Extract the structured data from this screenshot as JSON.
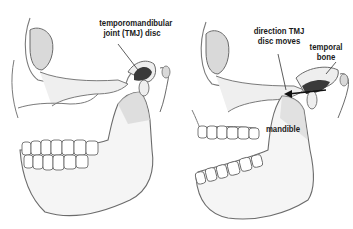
{
  "figures": [
    {
      "id": "closed-jaw",
      "labels": {
        "disc_line1": "temporomandibular",
        "disc_line2": "joint (TMJ) disc"
      }
    },
    {
      "id": "open-jaw",
      "labels": {
        "direction_line1": "direction TMJ",
        "direction_line2": "disc moves",
        "temporal_line1": "temporal",
        "temporal_line2": "bone",
        "mandible": "mandible"
      }
    }
  ],
  "colors": {
    "bone_outline": "#6b6b6b",
    "bone_fill": "#f4f4f4",
    "shade": "#c9c9c9",
    "disc": "#3a3a3a",
    "text": "#1a1a1a"
  }
}
